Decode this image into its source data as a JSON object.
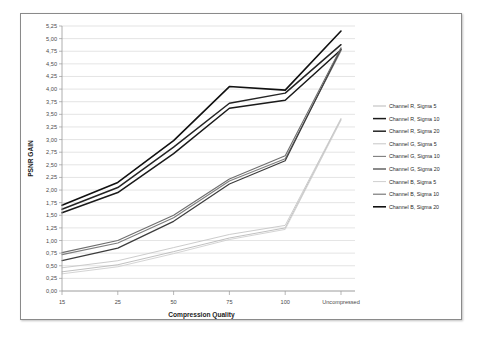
{
  "chart_data": {
    "type": "line",
    "title": "",
    "xlabel": "Compression Quality",
    "ylabel": "PSNR GAIN",
    "categories": [
      "15",
      "25",
      "50",
      "75",
      "100",
      "Uncompressed"
    ],
    "ylim": [
      0.0,
      5.25
    ],
    "ytick_step": 0.25,
    "ytick_labels": [
      "0,00",
      "0,25",
      "0,50",
      "0,75",
      "1,00",
      "1,25",
      "1,50",
      "1,75",
      "2,00",
      "2,25",
      "2,50",
      "2,75",
      "3,00",
      "3,25",
      "3,50",
      "3,75",
      "4,00",
      "4,25",
      "4,50",
      "4,75",
      "5,00",
      "5,25"
    ],
    "decimal_separator": ",",
    "grid": true,
    "legend_position": "right",
    "series": [
      {
        "name": "Channel R, Sigma 5",
        "color": "#b9b9b9",
        "width": 0.9,
        "values": [
          0.38,
          0.52,
          0.78,
          1.05,
          1.25,
          3.4
        ]
      },
      {
        "name": "Channel R, Sigma 10",
        "color": "#1a1a1a",
        "width": 1.5,
        "values": [
          1.55,
          1.95,
          2.72,
          3.62,
          3.78,
          4.78
        ]
      },
      {
        "name": "Channel R, Sigma 20",
        "color": "#242424",
        "width": 1.5,
        "values": [
          1.62,
          2.05,
          2.85,
          3.72,
          3.92,
          4.88
        ]
      },
      {
        "name": "Channel G, Sigma 5",
        "color": "#c6c6c6",
        "width": 0.9,
        "values": [
          0.46,
          0.6,
          0.86,
          1.12,
          1.3,
          3.42
        ]
      },
      {
        "name": "Channel G, Sigma 10",
        "color": "#7d7d7d",
        "width": 1.1,
        "values": [
          0.72,
          0.95,
          1.45,
          2.18,
          2.62,
          4.76
        ]
      },
      {
        "name": "Channel G, Sigma 20",
        "color": "#3c3c3c",
        "width": 1.2,
        "values": [
          0.6,
          0.85,
          1.38,
          2.12,
          2.58,
          4.8
        ]
      },
      {
        "name": "Channel B, Sigma 5",
        "color": "#cfcfcf",
        "width": 0.9,
        "values": [
          0.34,
          0.48,
          0.74,
          1.02,
          1.22,
          3.38
        ]
      },
      {
        "name": "Channel B, Sigma 10",
        "color": "#6e6e6e",
        "width": 1.1,
        "values": [
          0.76,
          1.0,
          1.5,
          2.22,
          2.68,
          4.82
        ]
      },
      {
        "name": "Channel B, Sigma 20",
        "color": "#111111",
        "width": 1.6,
        "values": [
          1.7,
          2.15,
          2.98,
          4.05,
          3.98,
          5.15
        ]
      }
    ]
  }
}
